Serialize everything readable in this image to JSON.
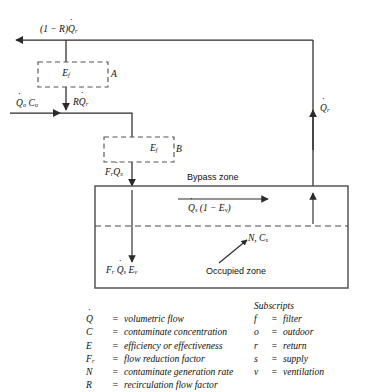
{
  "diagram": {
    "title_flows": {
      "exhaust": "(1 − R)Q̇r",
      "outdoor": "Q̇o Co",
      "recirculated": "RQ̇r",
      "supply_to_room": "FrQ̇s",
      "return": "Q̇r",
      "bypass_flow": "Q̇s (1 − Ev)",
      "occupied_flow": "Fr Q̇s Ev",
      "generation": "N, Cs"
    },
    "filters": {
      "box_a_symbol": "Ef",
      "box_a_label": "A",
      "box_b_symbol": "Ef",
      "box_b_label": "B"
    },
    "zones": {
      "bypass": "Bypass zone",
      "occupied": "Occupied zone"
    }
  },
  "legend": {
    "left": [
      {
        "symbol": "Q̇",
        "eq": "=",
        "definition": "volumetric flow"
      },
      {
        "symbol": "C",
        "eq": "=",
        "definition": "contaminate concentration"
      },
      {
        "symbol": "E",
        "eq": "=",
        "definition": "efficiency or effectiveness"
      },
      {
        "symbol": "Fr",
        "eq": "=",
        "definition": "flow reduction factor"
      },
      {
        "symbol": "N",
        "eq": "=",
        "definition": "contaminate generation rate"
      },
      {
        "symbol": "R",
        "eq": "=",
        "definition": "recirculation flow factor"
      }
    ],
    "right_heading": "Subscripts",
    "right": [
      {
        "symbol": "f",
        "eq": "=",
        "definition": "filter"
      },
      {
        "symbol": "o",
        "eq": "=",
        "definition": "outdoor"
      },
      {
        "symbol": "r",
        "eq": "=",
        "definition": "return"
      },
      {
        "symbol": "s",
        "eq": "=",
        "definition": "supply"
      },
      {
        "symbol": "v",
        "eq": "=",
        "definition": "ventilation"
      }
    ]
  },
  "colors": {
    "line": "#2b2b2b",
    "dashed": "#555555",
    "text": "#111111",
    "background": "#ffffff"
  }
}
